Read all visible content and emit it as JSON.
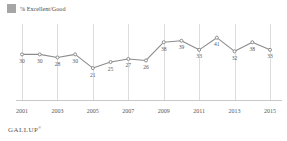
{
  "legend": {
    "swatch_color": "#a6a6a6",
    "label": "% Excellent/Good"
  },
  "brand": {
    "name": "GALLUP",
    "mark": "®"
  },
  "chart_data": {
    "type": "line",
    "title": "",
    "xlabel": "",
    "ylabel": "",
    "grid": true,
    "legend_position": "top-left",
    "line_color": "#8c8c8c",
    "marker_color": "#8c8c8c",
    "ylim": [
      0,
      50
    ],
    "xlim": [
      2001,
      2015
    ],
    "x": [
      2001,
      2002,
      2003,
      2004,
      2005,
      2006,
      2007,
      2008,
      2009,
      2010,
      2011,
      2012,
      2013,
      2014,
      2015
    ],
    "tick_labels": [
      "2001",
      "2003",
      "2005",
      "2007",
      "2009",
      "2011",
      "2013",
      "2015"
    ],
    "tick_values": [
      2001,
      2003,
      2005,
      2007,
      2009,
      2011,
      2013,
      2015
    ],
    "series": [
      {
        "name": "% Excellent/Good",
        "values": [
          30,
          30,
          28,
          30,
          21,
          25,
          27,
          26,
          38,
          39,
          33,
          41,
          32,
          38,
          33
        ]
      }
    ],
    "point_labels": [
      "30",
      "30",
      "28",
      "30",
      "21",
      "25",
      "27",
      "26",
      "38",
      "39",
      "33",
      "41",
      "32",
      "38",
      "33"
    ],
    "point_label_positions": [
      "below",
      "below",
      "below",
      "below",
      "below",
      "below",
      "below",
      "below",
      "below",
      "below",
      "below",
      "below",
      "below",
      "below",
      "below"
    ]
  }
}
